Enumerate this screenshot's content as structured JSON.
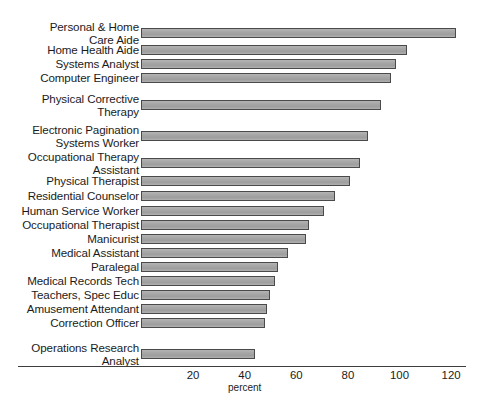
{
  "chart_data": {
    "type": "bar",
    "orientation": "horizontal",
    "title": "",
    "subtitle": "",
    "xlabel": "percent",
    "ylabel": "",
    "xlim": [
      0,
      128
    ],
    "xticks": [
      20,
      40,
      60,
      80,
      100,
      120
    ],
    "xtick_labels": [
      "20",
      "40",
      "60",
      "80",
      "100",
      "120"
    ],
    "grid": false,
    "legend": null,
    "bar_color": "#a8a8a8",
    "bar_edge_color": "#4a4a4a",
    "axis_color": "#3d3d3d",
    "background_color": "#ffffff",
    "categories": [
      "Personal & Home\nCare Aide",
      "Home Health Aide",
      "Systems Analyst",
      "Computer Engineer",
      "Physical Corrective\nTherapy",
      "Electronic Pagination\nSystems Worker",
      "Occupational Therapy\nAssistant",
      "Physical Therapist",
      "Residential Counselor",
      "Human Service Worker",
      "Occupational Therapist",
      "Manicurist",
      "Medical Assistant",
      "Paralegal",
      "Medical Records Tech",
      "Teachers, Spec Educ",
      "Amusement Attendant",
      "Correction Officer",
      "Operations Research\nAnalyst"
    ],
    "values": [
      122,
      103,
      99,
      97,
      93,
      88,
      85,
      81,
      75,
      71,
      65,
      64,
      57,
      53,
      52,
      50,
      49,
      48,
      44
    ]
  }
}
